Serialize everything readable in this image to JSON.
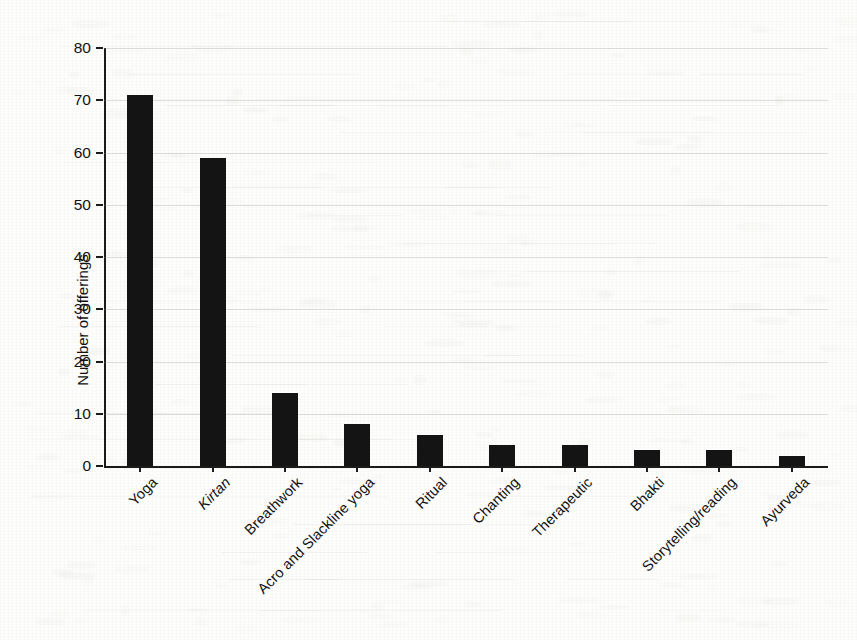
{
  "chart_data": {
    "type": "bar",
    "title": "",
    "xlabel": "",
    "ylabel": "Number of offerings",
    "ylim": [
      0,
      80
    ],
    "ytick_step": 10,
    "yticks": [
      0,
      10,
      20,
      30,
      40,
      50,
      60,
      70,
      80
    ],
    "grid": true,
    "grid_axis": "y",
    "legend": false,
    "legend_position": "none",
    "bar_color": "#141414",
    "orientation": "vertical",
    "xtick_rotation": -45,
    "categories": [
      "Yoga",
      "Kirtan",
      "Breathwork",
      "Acro and Slackline yoga",
      "Ritual",
      "Chanting",
      "Therapeutic",
      "Bhakti",
      "Storytelling/reading",
      "Ayurveda"
    ],
    "category_styles": [
      "normal",
      "italic",
      "normal",
      "normal",
      "normal",
      "normal",
      "normal",
      "normal",
      "normal",
      "normal"
    ],
    "values": [
      71,
      59,
      14,
      8,
      6,
      4,
      4,
      3,
      3,
      2
    ]
  },
  "figure": {
    "background_color": "#fdfdfb",
    "axis_color": "#1b1b1b",
    "gridline_color": "#969489",
    "text_color": "#111111",
    "scan_artifact": "faint reverse-side text show-through"
  }
}
